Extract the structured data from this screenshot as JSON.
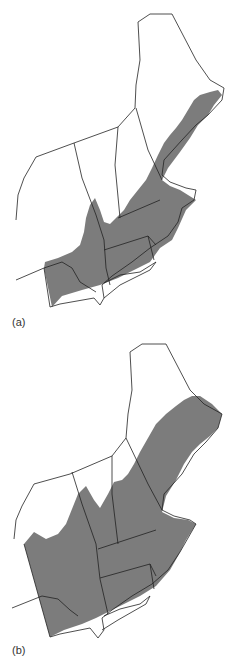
{
  "figure": {
    "panels": [
      {
        "label": "(a)",
        "region": "Northeastern United States",
        "shading": "lower-coverage extent (southern/coastal)"
      },
      {
        "label": "(b)",
        "region": "Northeastern United States",
        "shading": "higher-coverage extent (most of region)"
      }
    ],
    "colors": {
      "shade": "#7c7c7c",
      "border": "#222222",
      "background": "#ffffff"
    }
  }
}
